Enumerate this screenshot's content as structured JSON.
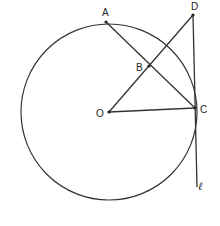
{
  "diagram": {
    "type": "geometry",
    "circle": {
      "center": "O",
      "cx": 109,
      "cy": 112,
      "r": 88
    },
    "points": {
      "A": {
        "label": "A",
        "x": 106,
        "y": 22
      },
      "B": {
        "label": "B",
        "x": 149,
        "y": 66
      },
      "C": {
        "label": "C",
        "x": 195,
        "y": 108
      },
      "D": {
        "label": "D",
        "x": 193,
        "y": 15
      },
      "O": {
        "label": "O",
        "x": 109,
        "y": 112
      }
    },
    "segments": [
      {
        "from": "A",
        "to": "C"
      },
      {
        "from": "O",
        "to": "D"
      },
      {
        "from": "O",
        "to": "C"
      }
    ],
    "tangent_line": {
      "label": "ℓ",
      "through": [
        "D",
        "C"
      ],
      "end": {
        "x": 197,
        "y": 187
      }
    },
    "colors": {
      "stroke": "#333333",
      "background": "#ffffff"
    }
  }
}
